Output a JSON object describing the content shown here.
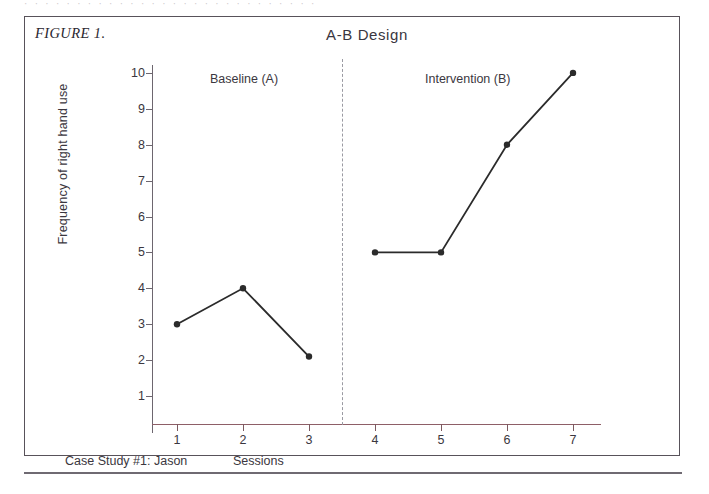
{
  "scan": {
    "top_cut_text": "· ·  · ·  ·  ·   ·  · ·  ·  ·  ·  ·  ·  ·   ·  ·  ·   ·  ·  ·  ·   ·  ·  ·   ·  ·  ·"
  },
  "figure": {
    "label": "FIGURE 1.",
    "title": "A-B  Design",
    "footnote_left": "Case Study #1: Jason",
    "footnote_mid": "Sessions"
  },
  "colors": {
    "border": "#58525a",
    "axis_y": "#6d666f",
    "axis_x": "#8e5f67",
    "series": "#2b2b2b",
    "divider": "#9a9aa2",
    "text": "#3b3740"
  },
  "chart_data": {
    "type": "line",
    "title": "A-B  Design",
    "xlabel": "Sessions",
    "ylabel": "Frequency of right hand use",
    "xlim": [
      0,
      7.6
    ],
    "ylim": [
      0,
      10.4
    ],
    "grid": false,
    "legend": "none",
    "x": [
      1,
      2,
      3,
      4,
      5,
      6,
      7
    ],
    "values": [
      3,
      4,
      2.1,
      5,
      5,
      8,
      10
    ],
    "series": [
      {
        "name": "Baseline (A)",
        "x": [
          1,
          2,
          3
        ],
        "values": [
          3,
          4,
          2.1
        ]
      },
      {
        "name": "Intervention (B)",
        "x": [
          4,
          5,
          6,
          7
        ],
        "values": [
          5,
          5,
          8,
          10
        ]
      }
    ],
    "xticks": [
      "1",
      "2",
      "3",
      "4",
      "5",
      "6",
      "7"
    ],
    "yticks": [
      "1",
      "2",
      "3",
      "4",
      "5",
      "6",
      "7",
      "8",
      "9",
      "10"
    ],
    "annotations": [
      {
        "text": "Baseline (A)",
        "x": 2.0,
        "y": 10.1
      },
      {
        "text": "Intervention (B)",
        "x": 5.45,
        "y": 10.1
      }
    ],
    "phase_divider_x": 3.5
  }
}
